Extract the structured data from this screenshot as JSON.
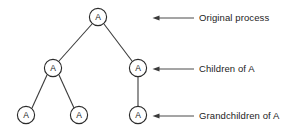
{
  "diagram": {
    "type": "process-tree",
    "background_color": "#ffffff",
    "node_stroke_color": "#2b2b2b",
    "edge_color": "#3b3b3b",
    "callout_color": "#4a4a4a",
    "text_color": "#1c1c1c",
    "node_label": "A",
    "nodes": [
      {
        "id": "root",
        "label": "A",
        "level": 0,
        "cx": 98,
        "cy": 17,
        "r": 8.6
      },
      {
        "id": "c1",
        "label": "A",
        "level": 1,
        "cx": 53,
        "cy": 68,
        "r": 8.6
      },
      {
        "id": "c2",
        "label": "A",
        "level": 1,
        "cx": 138,
        "cy": 68,
        "r": 8.6
      },
      {
        "id": "g1",
        "label": "A",
        "level": 2,
        "cx": 26,
        "cy": 115,
        "r": 8.6
      },
      {
        "id": "g2",
        "label": "A",
        "level": 2,
        "cx": 79,
        "cy": 115,
        "r": 8.6
      },
      {
        "id": "g3",
        "label": "A",
        "level": 2,
        "cx": 138,
        "cy": 115,
        "r": 8.6
      }
    ],
    "edges": [
      {
        "from": "root",
        "to": "c1"
      },
      {
        "from": "root",
        "to": "c2"
      },
      {
        "from": "c1",
        "to": "g1"
      },
      {
        "from": "c1",
        "to": "g2"
      },
      {
        "from": "c2",
        "to": "g3"
      }
    ],
    "callouts": [
      {
        "id": "callout-original-process",
        "label": "Original process",
        "arrow_tip_x": 153,
        "arrow_tail_x": 194,
        "y": 18,
        "text_x": 199
      },
      {
        "id": "callout-children-of-a",
        "label": "Children of A",
        "arrow_tip_x": 153,
        "arrow_tail_x": 194,
        "y": 69,
        "text_x": 199
      },
      {
        "id": "callout-grandchildren-of-a",
        "label": "Grandchildren of A",
        "arrow_tip_x": 153,
        "arrow_tail_x": 194,
        "y": 116,
        "text_x": 199
      }
    ]
  }
}
